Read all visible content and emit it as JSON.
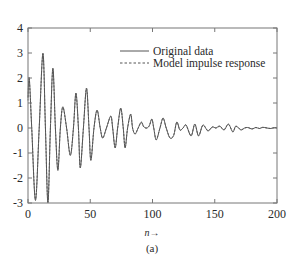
{
  "chart_data": {
    "type": "line",
    "title": "",
    "xlabel": "n→",
    "ylabel": "",
    "caption": "(a)",
    "xlim": [
      0,
      200
    ],
    "ylim": [
      -3,
      4
    ],
    "xticks": [
      0,
      50,
      100,
      150,
      200
    ],
    "xtick_labels": [
      "0",
      "50",
      "100",
      "150",
      "200"
    ],
    "yticks": [
      4,
      3,
      2,
      1,
      0,
      -1,
      -2,
      -3
    ],
    "ytick_labels": [
      "4",
      "3",
      "2",
      "1",
      "0",
      "-1",
      "-2",
      "-3"
    ],
    "grid": false,
    "legend_position": "upper right (inside)",
    "legend": [
      {
        "label": "Original data",
        "style": "solid"
      },
      {
        "label": "Model impulse response",
        "style": "dashed"
      }
    ],
    "series": [
      {
        "name": "Original data",
        "style": "solid",
        "x": [
          0,
          1,
          3,
          6,
          9,
          12,
          14,
          16,
          18,
          20,
          22,
          24,
          26,
          28,
          31,
          34,
          36.5,
          38.5,
          40.5,
          42,
          44.5,
          47,
          49,
          50.5,
          53,
          55.5,
          58,
          60,
          63,
          66.5,
          68,
          70,
          72,
          74.5,
          76.5,
          78,
          80,
          82.5,
          84,
          86,
          88.5,
          91,
          93,
          95.5,
          97.5,
          99.5,
          101,
          103,
          106,
          108.5,
          111,
          114,
          117,
          119.5,
          122,
          124.5,
          127,
          131,
          134,
          137,
          140.5,
          144.5,
          148,
          151,
          154,
          157.5,
          161,
          164.5,
          167,
          171,
          174,
          176.5,
          180,
          183,
          186,
          188.5,
          192,
          195,
          198,
          200
        ],
        "y": [
          1.2,
          2.0,
          0.0,
          -2.9,
          0.0,
          3.0,
          0.0,
          -3.0,
          0.0,
          2.4,
          0.0,
          -1.7,
          0.0,
          0.85,
          0.0,
          -1.1,
          0.0,
          1.4,
          0.0,
          -1.6,
          0.0,
          1.6,
          0.0,
          -1.3,
          0.0,
          0.72,
          0.0,
          -0.4,
          0.0,
          0.48,
          0.0,
          -0.8,
          0.0,
          0.8,
          0.0,
          -0.8,
          0.0,
          0.56,
          0.0,
          -0.24,
          0.0,
          0.24,
          0.05,
          0.0,
          0.1,
          0.36,
          0.0,
          -0.48,
          0.0,
          0.4,
          0.0,
          -0.4,
          -0.3,
          0.24,
          -0.08,
          0.0,
          0.12,
          -0.32,
          0.16,
          -0.32,
          0.12,
          -0.12,
          0.04,
          0.0,
          0.08,
          -0.08,
          0.16,
          -0.16,
          0.08,
          -0.08,
          0.0,
          0.02,
          -0.04,
          0.02,
          -0.02,
          0.03,
          0.0,
          -0.02,
          0.02,
          0.0
        ]
      },
      {
        "name": "Model impulse response",
        "style": "dashed",
        "x": [
          0,
          1,
          3,
          6,
          9,
          12,
          14,
          16,
          18,
          20,
          22,
          24,
          26,
          28,
          31,
          34,
          36.5,
          38.5,
          40.5,
          42,
          44.5,
          47,
          49,
          50.5,
          53,
          55.5,
          58,
          60,
          63,
          66.5,
          68,
          70,
          72,
          74.5,
          76.5,
          78,
          80,
          82.5,
          84,
          86,
          88.5,
          91,
          93,
          95.5,
          97.5,
          99.5,
          101,
          103,
          106,
          108.5,
          111,
          114,
          117,
          119.5,
          122,
          124.5,
          127,
          131,
          134,
          137,
          140.5,
          144.5,
          148,
          151,
          154,
          157.5,
          161,
          164.5,
          167,
          171,
          174,
          176.5,
          180,
          183,
          186,
          188.5,
          192,
          195,
          198,
          200
        ],
        "y": [
          1.1,
          1.95,
          0.0,
          -2.85,
          0.0,
          2.95,
          0.0,
          -2.95,
          0.0,
          2.35,
          0.0,
          -1.65,
          0.0,
          0.82,
          0.0,
          -1.08,
          0.0,
          1.38,
          0.0,
          -1.58,
          0.0,
          1.57,
          0.0,
          -1.28,
          0.0,
          0.7,
          0.0,
          -0.4,
          0.0,
          0.46,
          0.0,
          -0.78,
          0.0,
          0.78,
          0.0,
          -0.78,
          0.0,
          0.54,
          0.0,
          -0.24,
          0.0,
          0.22,
          0.04,
          0.0,
          0.1,
          0.34,
          0.0,
          -0.46,
          0.0,
          0.38,
          0.0,
          -0.38,
          -0.28,
          0.22,
          -0.08,
          0.0,
          0.1,
          -0.3,
          0.14,
          -0.3,
          0.1,
          -0.1,
          0.04,
          0.0,
          0.06,
          -0.06,
          0.14,
          -0.14,
          0.06,
          -0.06,
          0.0,
          0.02,
          -0.03,
          0.02,
          -0.02,
          0.02,
          0.0,
          -0.02,
          0.02,
          0.0
        ]
      }
    ]
  },
  "layout": {
    "plot_left": 28,
    "plot_top": 28,
    "plot_right": 277,
    "plot_bottom": 203,
    "line_color": "#555555",
    "axis_color": "#777777"
  }
}
